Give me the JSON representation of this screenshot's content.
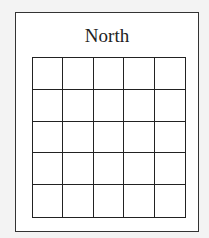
{
  "diagram": {
    "title": "North",
    "grid": {
      "rows": 5,
      "columns": 5
    },
    "colors": {
      "line": "#222222",
      "background": "#ffffff",
      "page": "#f3f3f3"
    }
  }
}
